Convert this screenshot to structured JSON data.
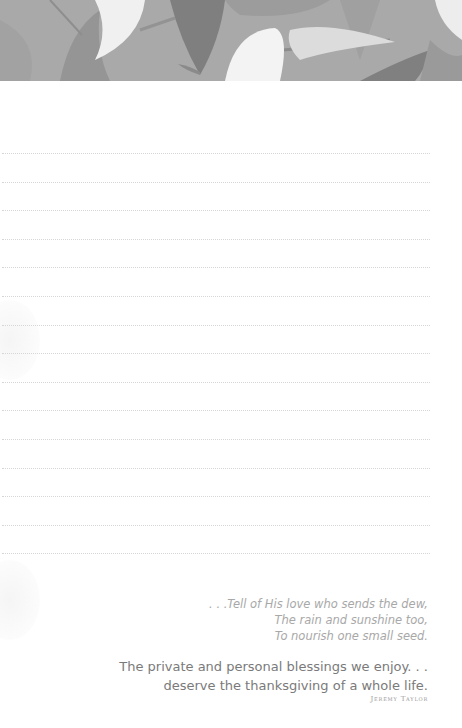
{
  "header": {
    "image": "calla-lily-floral-illustration",
    "colors": {
      "background": "#a9a9a9",
      "leaf_dark": "#7f7f7f",
      "leaf_mid": "#959595",
      "flower": "#f2f2f2"
    }
  },
  "ruled_lines": {
    "count": 15,
    "style": "dotted",
    "color": "#d6d6d6"
  },
  "poem": {
    "lines": [
      ". . .Tell of  His love who sends the dew,",
      "The rain and sunshine too,",
      "To nourish one small seed."
    ]
  },
  "quote": {
    "lines": [
      "The private and personal blessings we enjoy. . .",
      "deserve the thanksgiving of a whole life."
    ],
    "author": "Jeremy Taylor"
  }
}
